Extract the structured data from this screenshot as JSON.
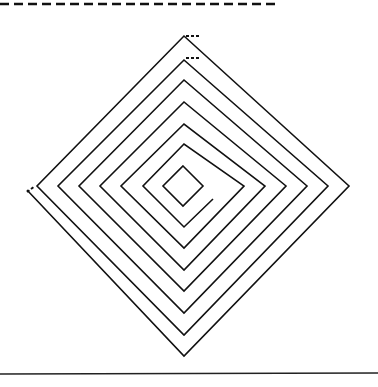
{
  "figure": {
    "type": "square-spiral-diamond",
    "stroke_color": "#111111",
    "background": "#ffffff",
    "top_rule": {
      "style": "dashed",
      "y": 4,
      "x_start": 0,
      "x_end": 280
    },
    "bottom_rule": {
      "style": "solid",
      "y": 374,
      "x_start": 0,
      "x_end": 378
    },
    "inner_diamond": {
      "cx": 183,
      "cy": 186,
      "r": 20
    },
    "spiral_points": "213,199 184,227 143,186 184,144 244,186 184,248 121,186 184,124 265,186 184,270 100,186 184,102 286,186 184,291 79,186 184,80 307,186 184,313 58,186 184,60 328,186 184,335 37,186 184,36 349,186 184,356 27,190"
  }
}
